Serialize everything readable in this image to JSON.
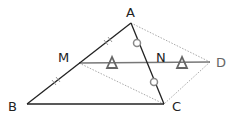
{
  "diagram": {
    "title": "",
    "points": {
      "A": {
        "label": "A",
        "x": 131,
        "y": 23
      },
      "B": {
        "label": "B",
        "x": 27,
        "y": 104
      },
      "C": {
        "label": "C",
        "x": 164,
        "y": 104
      },
      "D": {
        "label": "D",
        "x": 210,
        "y": 62
      },
      "M": {
        "label": "M",
        "x": 79,
        "y": 63
      },
      "N": {
        "label": "N",
        "x": 147,
        "y": 63
      }
    },
    "segments": [
      {
        "from": "A",
        "to": "B",
        "style": "solid"
      },
      {
        "from": "A",
        "to": "C",
        "style": "solid"
      },
      {
        "from": "B",
        "to": "C",
        "style": "solid"
      },
      {
        "from": "M",
        "to": "D",
        "style": "solid-gray"
      },
      {
        "from": "A",
        "to": "D",
        "style": "dotted"
      },
      {
        "from": "D",
        "to": "C",
        "style": "dotted"
      },
      {
        "from": "M",
        "to": "C",
        "style": "dotted"
      }
    ],
    "markers": {
      "equal_ticks_AB": "double-tick",
      "equal_circles_AC": "circle",
      "equal_triangles_MD": "triangle"
    },
    "colors": {
      "line": "#222222",
      "gray_line": "#777777",
      "dotted": "#999999",
      "marker": "#666666"
    }
  }
}
